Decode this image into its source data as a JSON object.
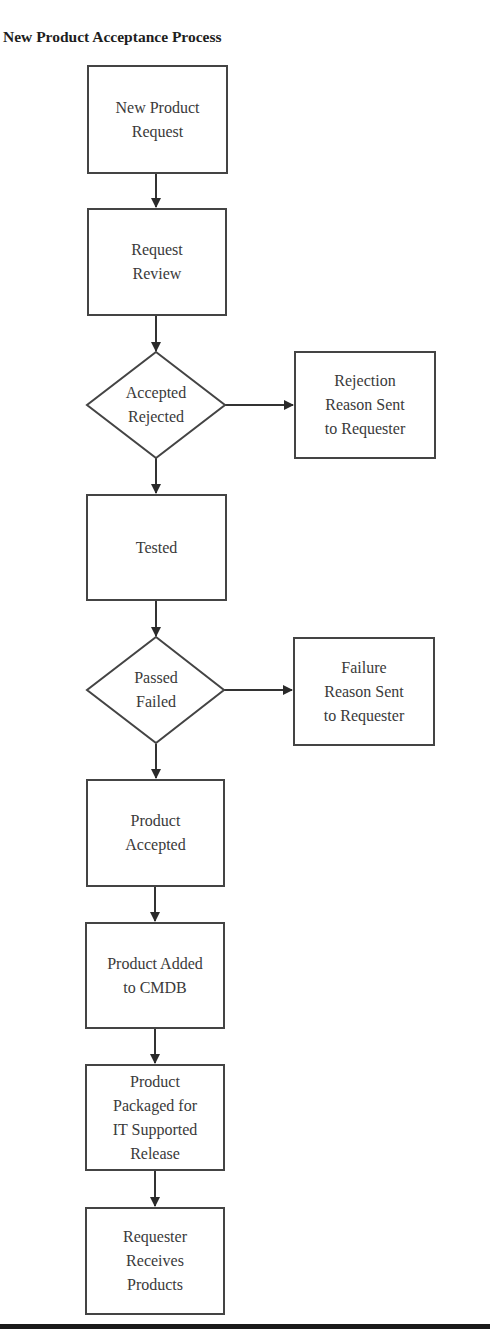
{
  "title": "New Product Acceptance Process",
  "colors": {
    "stroke": "#444444",
    "text": "#3a3a3a",
    "background": "#ffffff",
    "rule": "#1a1a1a"
  },
  "nodes": [
    {
      "id": "n1",
      "type": "process",
      "lines": [
        "New Product",
        "Request"
      ]
    },
    {
      "id": "n2",
      "type": "process",
      "lines": [
        "Request",
        "Review"
      ]
    },
    {
      "id": "d1",
      "type": "decision",
      "lines": [
        "Accepted",
        "Rejected"
      ]
    },
    {
      "id": "r1",
      "type": "process",
      "lines": [
        "Rejection",
        "Reason Sent",
        "to Requester"
      ]
    },
    {
      "id": "n3",
      "type": "process",
      "lines": [
        "Tested"
      ]
    },
    {
      "id": "d2",
      "type": "decision",
      "lines": [
        "Passed",
        "Failed"
      ]
    },
    {
      "id": "r2",
      "type": "process",
      "lines": [
        "Failure",
        "Reason Sent",
        "to Requester"
      ]
    },
    {
      "id": "n4",
      "type": "process",
      "lines": [
        "Product",
        "Accepted"
      ]
    },
    {
      "id": "n5",
      "type": "process",
      "lines": [
        "Product Added",
        "to CMDB"
      ]
    },
    {
      "id": "n6",
      "type": "process",
      "lines": [
        "Product",
        "Packaged for",
        "IT Supported",
        "Release"
      ]
    },
    {
      "id": "n7",
      "type": "process",
      "lines": [
        "Requester",
        "Receives",
        "Products"
      ]
    }
  ],
  "edges": [
    {
      "from": "n1",
      "to": "n2"
    },
    {
      "from": "n2",
      "to": "d1"
    },
    {
      "from": "d1",
      "to": "r1"
    },
    {
      "from": "d1",
      "to": "n3"
    },
    {
      "from": "n3",
      "to": "d2"
    },
    {
      "from": "d2",
      "to": "r2"
    },
    {
      "from": "d2",
      "to": "n4"
    },
    {
      "from": "n4",
      "to": "n5"
    },
    {
      "from": "n5",
      "to": "n6"
    },
    {
      "from": "n6",
      "to": "n7"
    }
  ]
}
